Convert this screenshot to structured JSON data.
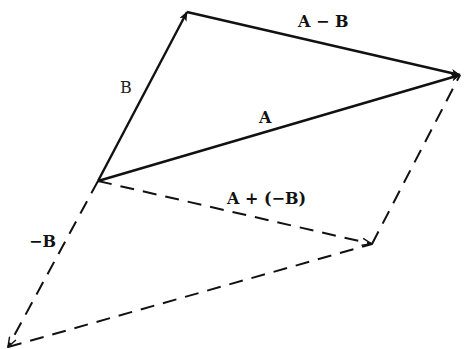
{
  "diagram": {
    "colors": {
      "line": "#111111",
      "background": "#ffffff"
    },
    "points": {
      "origin": [
        98,
        181
      ],
      "B_tip": [
        187,
        12
      ],
      "A_tip": [
        460,
        75
      ],
      "negB_tip": [
        8,
        347
      ],
      "sum_tip": [
        372,
        244
      ]
    },
    "vectors": [
      {
        "id": "A",
        "label": "A",
        "from": "origin",
        "to": "A_tip",
        "style": "solid"
      },
      {
        "id": "B",
        "label": "B",
        "from": "origin",
        "to": "B_tip",
        "style": "solid"
      },
      {
        "id": "A-B",
        "label": "A − B",
        "from": "B_tip",
        "to": "A_tip",
        "style": "solid"
      },
      {
        "id": "-B",
        "label": "−B",
        "from": "origin",
        "to": "negB_tip",
        "style": "dashed"
      },
      {
        "id": "A+(-B)",
        "label": "A + (−B)",
        "from": "origin",
        "to": "sum_tip",
        "style": "dashed"
      },
      {
        "id": "A-shifted",
        "label": "",
        "from": "negB_tip",
        "to": "sum_tip",
        "style": "dashed"
      },
      {
        "id": "B-shifted",
        "label": "",
        "from": "sum_tip",
        "to": "A_tip",
        "style": "dashed"
      }
    ],
    "labels": {
      "A": "A",
      "B": "B",
      "A_minus_B": "A − B",
      "neg_B": "−B",
      "A_plus_negB": "A + (−B)"
    }
  }
}
